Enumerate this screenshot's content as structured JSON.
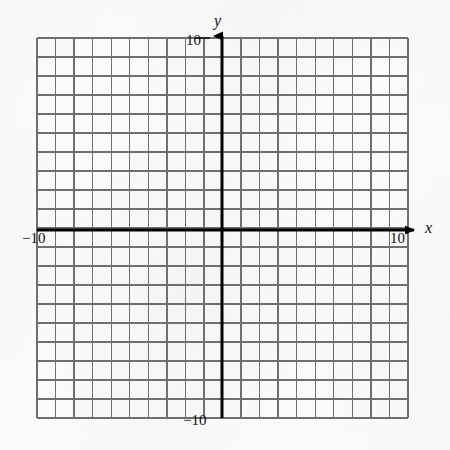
{
  "figure": {
    "title": "",
    "type": "coordinate-grid",
    "background_color": "#fbfbfa",
    "grid_line_color": "#6f6f6f",
    "axis_line_color": "#000000",
    "text_color": "#111111"
  },
  "axes": {
    "x": {
      "name": "x",
      "min_label": "−10",
      "max_label": "10",
      "min_value": -10,
      "max_value": 10,
      "tick_step": 1,
      "arrow": "right"
    },
    "y": {
      "name": "y",
      "min_label": "−10",
      "max_label": "10",
      "min_value": -10,
      "max_value": 10,
      "tick_step": 1,
      "arrow": "up"
    }
  },
  "chart_data": {
    "type": "scatter",
    "title": "",
    "xlabel": "x",
    "ylabel": "y",
    "xlim": [
      -10,
      10
    ],
    "ylim": [
      -10,
      10
    ],
    "xticks": [
      -10,
      -9,
      -8,
      -7,
      -6,
      -5,
      -4,
      -3,
      -2,
      -1,
      0,
      1,
      2,
      3,
      4,
      5,
      6,
      7,
      8,
      9,
      10
    ],
    "yticks": [
      -10,
      -9,
      -8,
      -7,
      -6,
      -5,
      -4,
      -3,
      -2,
      -1,
      0,
      1,
      2,
      3,
      4,
      5,
      6,
      7,
      8,
      9,
      10
    ],
    "xtick_labels_shown": [
      "−10",
      "10"
    ],
    "ytick_labels_shown": [
      "−10",
      "10"
    ],
    "grid": true,
    "grid_minor_step": 1,
    "legend": null,
    "series": [],
    "annotations": []
  },
  "labels": {
    "y_top": "10",
    "y_bottom": "−10",
    "x_left": "−10",
    "x_right": "10",
    "axis_x": "x",
    "axis_y": "y"
  },
  "geometry": {
    "grid_left": 37,
    "grid_right": 408,
    "grid_top": 38,
    "grid_bottom": 418,
    "origin_x": 222,
    "origin_y": 230,
    "cells_x": 20,
    "cells_y": 20
  }
}
